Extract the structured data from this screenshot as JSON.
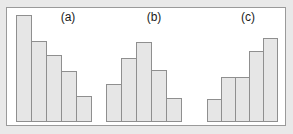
{
  "figure": {
    "background_color": "#e9e9e9",
    "panel_color": "#ffffff",
    "border_color": "#9a9a9a",
    "bar_fill_color": "#e6e6e6",
    "bar_border_color": "#8f8f8f"
  },
  "labels": {
    "a": "(a)",
    "b": "(b)",
    "c": "(c)"
  },
  "chart_data": [
    {
      "type": "bar",
      "title": "(a)",
      "categories": [
        "1",
        "2",
        "3",
        "4",
        "5"
      ],
      "values": [
        109,
        82,
        68,
        52,
        26
      ],
      "xlabel": "",
      "ylabel": "",
      "ylim": [
        0,
        115
      ],
      "grid": false,
      "legend": "none",
      "shape": "monotonically decreasing",
      "bar_width_px": 16,
      "bar_widths": [
        16,
        16,
        16,
        16,
        16
      ]
    },
    {
      "type": "bar",
      "title": "(b)",
      "categories": [
        "1",
        "2",
        "3",
        "4",
        "5"
      ],
      "values": [
        39,
        65,
        81,
        53,
        24
      ],
      "xlabel": "",
      "ylabel": "",
      "ylim": [
        0,
        115
      ],
      "grid": false,
      "legend": "none",
      "shape": "unimodal peak at category 3",
      "bar_width_px": 16,
      "bar_widths": [
        16,
        16,
        16,
        16,
        16
      ]
    },
    {
      "type": "bar",
      "title": "(c)",
      "categories": [
        "1",
        "2",
        "3",
        "4",
        "5"
      ],
      "values": [
        23,
        46,
        46,
        72,
        85
      ],
      "xlabel": "",
      "ylabel": "",
      "ylim": [
        0,
        115
      ],
      "grid": false,
      "legend": "none",
      "shape": "monotonically increasing with plateau at categories 2-3",
      "bar_width_px": 15,
      "bar_widths": [
        15,
        15,
        15,
        15,
        15
      ]
    }
  ]
}
